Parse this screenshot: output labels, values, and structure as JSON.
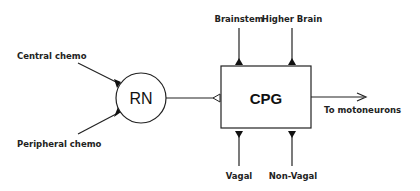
{
  "diagram": {
    "nodes": {
      "rn": {
        "label": "RN"
      },
      "cpg": {
        "label": "CPG"
      }
    },
    "inputs": {
      "central_chemo": "Central chemo",
      "peripheral_chemo": "Peripheral chemo",
      "brainstem": "Brainstem",
      "higher_brain": "Higher Brain",
      "vagal": "Vagal",
      "non_vagal": "Non-Vagal"
    },
    "outputs": {
      "motoneurons": "To motoneurons"
    },
    "colors": {
      "stroke": "#222222",
      "background": "#ffffff"
    }
  }
}
